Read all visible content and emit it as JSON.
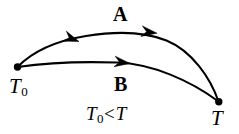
{
  "figure": {
    "background_color": "#ffffff",
    "stroke_color": "#000000",
    "width": 239,
    "height": 134
  },
  "nodes": [
    {
      "id": "start",
      "symbol": "T",
      "subscript": "0",
      "label_text": "T0",
      "x": 17,
      "y": 67,
      "marker": "filled-dot"
    },
    {
      "id": "end",
      "symbol": "T",
      "subscript": "",
      "label_text": "T",
      "x": 219,
      "y": 102,
      "marker": "filled-dot"
    }
  ],
  "paths": [
    {
      "id": "path-a",
      "label": "A",
      "label_x": 122,
      "label_y": 14,
      "direction": "right-to-left",
      "arrow_count": 2,
      "description": "upper arc from T to T0"
    },
    {
      "id": "path-b",
      "label": "B",
      "label_x": 123,
      "label_y": 84,
      "direction": "left-to-right",
      "arrow_count": 1,
      "description": "lower arc from T0 to T"
    }
  ],
  "annotations": {
    "inequality": {
      "left_symbol": "T",
      "left_subscript": "0",
      "relation": "<",
      "right_symbol": "T",
      "full_text": "T0 < T",
      "x": 118,
      "y": 117
    }
  },
  "geometry": {
    "path_a_d": "M 17.5 67 C 34 50 58 40 86 36 C 112 32 142 31 166 40 C 192 50 210 78 218.5 101.5",
    "path_b_d": "M 17.5 67 C 48 62.5 84 61.5 117 62.5 C 152 63.5 190 80 218.5 101.5",
    "arrows": [
      {
        "path": "a",
        "x": 157,
        "y": 33,
        "angle": 188,
        "heading": "left"
      },
      {
        "path": "a",
        "x": 80,
        "y": 41,
        "angle": 200,
        "heading": "left"
      },
      {
        "path": "b",
        "x": 128,
        "y": 63,
        "angle": 6,
        "heading": "right"
      }
    ],
    "node_radius": 3.6,
    "stroke_width": 2.0
  }
}
